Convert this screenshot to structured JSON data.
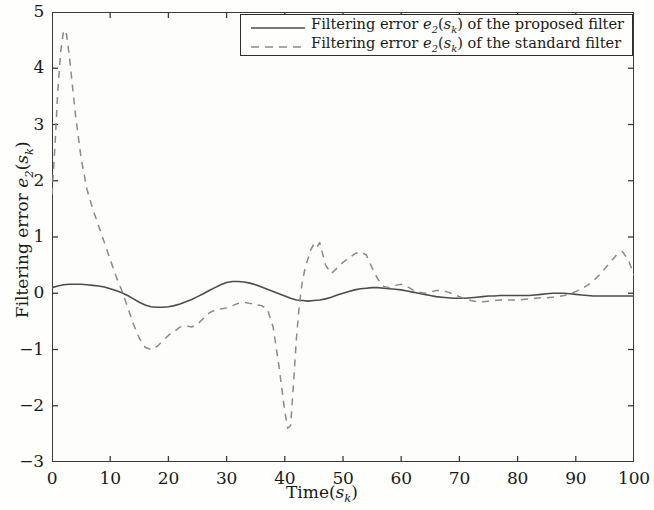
{
  "chart_data": {
    "type": "line",
    "title": "",
    "xlabel": "Time(s_k)",
    "ylabel": "Filtering error e_2(s_k)",
    "xlim": [
      0,
      100
    ],
    "ylim": [
      -3,
      5
    ],
    "xticks": [
      "0",
      "10",
      "20",
      "30",
      "40",
      "50",
      "60",
      "70",
      "80",
      "90",
      "100"
    ],
    "yticks": [
      "5",
      "4",
      "3",
      "2",
      "1",
      "0",
      "-1",
      "-2",
      "-3"
    ],
    "grid": false,
    "legend_position": "top-right",
    "series": [
      {
        "name": "Filtering error e_2(s_k) of the proposed filter",
        "style": "solid",
        "color": "#4d4d4d",
        "x": [
          0,
          1,
          2,
          3,
          4,
          5,
          6,
          7,
          8,
          9,
          10,
          11,
          12,
          13,
          14,
          15,
          16,
          17,
          18,
          19,
          20,
          21,
          22,
          23,
          24,
          25,
          26,
          27,
          28,
          29,
          30,
          31,
          32,
          33,
          34,
          35,
          36,
          37,
          38,
          39,
          40,
          41,
          42,
          43,
          44,
          45,
          46,
          47,
          48,
          49,
          50,
          51,
          52,
          53,
          54,
          55,
          56,
          57,
          58,
          59,
          60,
          61,
          62,
          63,
          64,
          65,
          66,
          67,
          68,
          69,
          70,
          71,
          72,
          73,
          74,
          75,
          76,
          77,
          78,
          79,
          80,
          81,
          82,
          83,
          84,
          85,
          86,
          87,
          88,
          89,
          90,
          91,
          92,
          93,
          94,
          95,
          96,
          97,
          98,
          99,
          100
        ],
        "y": [
          0.1,
          0.13,
          0.15,
          0.16,
          0.16,
          0.16,
          0.15,
          0.14,
          0.13,
          0.11,
          0.08,
          0.05,
          0.01,
          -0.04,
          -0.1,
          -0.16,
          -0.21,
          -0.24,
          -0.25,
          -0.25,
          -0.24,
          -0.22,
          -0.19,
          -0.15,
          -0.11,
          -0.06,
          -0.01,
          0.05,
          0.1,
          0.15,
          0.19,
          0.21,
          0.21,
          0.2,
          0.18,
          0.15,
          0.11,
          0.07,
          0.03,
          -0.01,
          -0.05,
          -0.09,
          -0.12,
          -0.13,
          -0.14,
          -0.13,
          -0.12,
          -0.1,
          -0.07,
          -0.03,
          0.0,
          0.03,
          0.06,
          0.08,
          0.09,
          0.1,
          0.1,
          0.09,
          0.08,
          0.07,
          0.06,
          0.04,
          0.02,
          0.0,
          -0.02,
          -0.04,
          -0.06,
          -0.07,
          -0.08,
          -0.09,
          -0.09,
          -0.09,
          -0.08,
          -0.07,
          -0.06,
          -0.05,
          -0.05,
          -0.04,
          -0.04,
          -0.04,
          -0.04,
          -0.04,
          -0.04,
          -0.03,
          -0.02,
          -0.01,
          0.0,
          0.0,
          0.0,
          -0.01,
          -0.02,
          -0.03,
          -0.04,
          -0.05,
          -0.05,
          -0.05,
          -0.05,
          -0.05,
          -0.05,
          -0.05,
          -0.05
        ]
      },
      {
        "name": "Filtering error e_2(s_k) of the standard filter",
        "style": "dashed",
        "color": "#8a8a8a",
        "x": [
          0,
          0.5,
          1,
          1.5,
          2,
          2.5,
          3,
          3.5,
          4,
          5,
          6,
          7,
          8,
          9,
          10,
          11,
          12,
          13,
          14,
          15,
          16,
          17,
          18,
          19,
          20,
          21,
          22,
          23,
          24,
          25,
          26,
          27,
          28,
          29,
          30,
          31,
          32,
          33,
          34,
          35,
          36,
          37,
          38,
          39,
          40,
          40.5,
          41,
          41.5,
          42,
          42.5,
          43,
          43.5,
          44,
          44.5,
          45,
          45.5,
          46,
          46.5,
          47,
          48,
          49,
          50,
          51,
          52,
          53,
          54,
          55,
          56,
          57,
          58,
          59,
          60,
          61,
          62,
          63,
          64,
          65,
          66,
          67,
          68,
          69,
          70,
          71,
          72,
          73,
          74,
          75,
          76,
          77,
          78,
          79,
          80,
          81,
          82,
          83,
          84,
          85,
          86,
          87,
          88,
          89,
          90,
          91,
          92,
          93,
          94,
          95,
          96,
          97,
          98,
          99,
          100
        ],
        "y": [
          1.75,
          2.6,
          3.6,
          4.3,
          4.68,
          4.6,
          4.2,
          3.7,
          3.2,
          2.4,
          1.85,
          1.5,
          1.2,
          0.9,
          0.6,
          0.3,
          0.05,
          -0.25,
          -0.55,
          -0.8,
          -0.96,
          -1.0,
          -0.95,
          -0.85,
          -0.75,
          -0.68,
          -0.6,
          -0.58,
          -0.6,
          -0.55,
          -0.45,
          -0.35,
          -0.3,
          -0.28,
          -0.26,
          -0.22,
          -0.18,
          -0.16,
          -0.18,
          -0.2,
          -0.22,
          -0.28,
          -0.6,
          -1.3,
          -2.1,
          -2.4,
          -2.35,
          -1.6,
          -0.8,
          -0.2,
          0.2,
          0.45,
          0.62,
          0.78,
          0.88,
          0.82,
          0.9,
          0.7,
          0.5,
          0.35,
          0.45,
          0.55,
          0.62,
          0.7,
          0.74,
          0.68,
          0.45,
          0.25,
          0.12,
          0.1,
          0.14,
          0.16,
          0.12,
          0.06,
          0.02,
          0.0,
          0.02,
          0.05,
          0.05,
          0.02,
          -0.02,
          -0.06,
          -0.1,
          -0.13,
          -0.15,
          -0.15,
          -0.14,
          -0.13,
          -0.12,
          -0.12,
          -0.12,
          -0.12,
          -0.11,
          -0.1,
          -0.09,
          -0.08,
          -0.08,
          -0.07,
          -0.06,
          -0.04,
          -0.01,
          0.03,
          0.08,
          0.14,
          0.22,
          0.32,
          0.44,
          0.56,
          0.68,
          0.74,
          0.6,
          0.32
        ]
      }
    ]
  },
  "axis": {
    "x_title_prefix": "Time(",
    "x_title_var": "s",
    "x_title_sub": "k",
    "x_title_suffix": ")",
    "y_title_prefix": "Filtering error ",
    "y_title_var": "e",
    "y_title_sub1": "2",
    "y_title_mid": "(",
    "y_title_var2": "s",
    "y_title_sub2": "k",
    "y_title_suffix": ")"
  },
  "legend": {
    "entries": [
      {
        "style": "solid",
        "prefix": "Filtering error ",
        "var": "e",
        "sub1": "2",
        "mid": "(",
        "var2": "s",
        "sub2": "k",
        "suffix": ") of the proposed filter"
      },
      {
        "style": "dashed",
        "prefix": "Filtering error ",
        "var": "e",
        "sub1": "2",
        "mid": "(",
        "var2": "s",
        "sub2": "k",
        "suffix": ") of the standard filter"
      }
    ]
  },
  "colors": {
    "solid_line": "#4d4d4d",
    "dashed_line": "#8a8a8a",
    "frame": "#3a3a3a",
    "background": "#fdfdfb"
  }
}
